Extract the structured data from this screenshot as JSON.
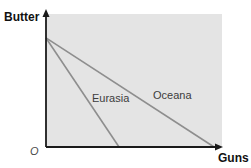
{
  "chart_data": {
    "type": "line",
    "title": "",
    "xlabel": "Guns",
    "ylabel": "Butter",
    "origin_label": "O",
    "xlim": [
      0,
      1
    ],
    "ylim": [
      0,
      1
    ],
    "grid": false,
    "legend_position": "inline-labels",
    "series": [
      {
        "name": "Eurasia",
        "points": [
          [
            0,
            0.82
          ],
          [
            0.415,
            0
          ]
        ]
      },
      {
        "name": "Oceana",
        "points": [
          [
            0,
            0.82
          ],
          [
            0.955,
            0
          ]
        ]
      }
    ]
  },
  "colors": {
    "plot_background": "#e4e4e4",
    "axis": "#1a1a1a",
    "ppf_line": "#8e8e8e",
    "series_label_text": "#3c3c3c"
  }
}
